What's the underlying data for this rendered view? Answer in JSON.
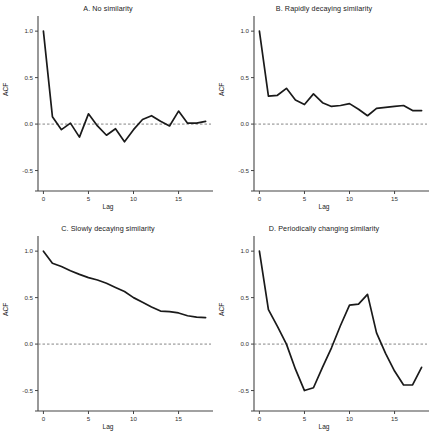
{
  "figure": {
    "name": "acf-panel-figure",
    "background": "#ffffff",
    "line_color": "#1a1a1a",
    "axis_color": "#444444",
    "zeroline_color": "#777777"
  },
  "axes": {
    "ylabel": "ACF",
    "xlabel": "Lag",
    "yticks": [
      "1.0",
      "0.5",
      "0.0",
      "-0.5"
    ],
    "ytick_values": [
      1.0,
      0.5,
      0.0,
      -0.5
    ],
    "xticks": [
      "0",
      "5",
      "10",
      "15"
    ],
    "xtick_values": [
      0,
      5,
      10,
      15
    ],
    "xlim": [
      -0.6,
      18.6
    ],
    "ylim": [
      -0.72,
      1.12
    ],
    "zero_line": 0.0,
    "grid": false
  },
  "chart_data": [
    {
      "type": "line",
      "panel": "A",
      "title": "A. No similarity",
      "xlabel": "Lag",
      "ylabel": "ACF",
      "xlim": [
        -0.6,
        18.6
      ],
      "ylim": [
        -0.72,
        1.12
      ],
      "grid": false,
      "legend": null,
      "x": [
        0,
        1,
        2,
        3,
        4,
        5,
        6,
        7,
        8,
        9,
        10,
        11,
        12,
        13,
        14,
        15,
        16,
        17,
        18
      ],
      "values": [
        1.0,
        0.08,
        -0.06,
        0.01,
        -0.14,
        0.11,
        -0.02,
        -0.12,
        -0.05,
        -0.19,
        -0.06,
        0.05,
        0.09,
        0.03,
        -0.02,
        0.14,
        0.01,
        0.01,
        0.03
      ]
    },
    {
      "type": "line",
      "panel": "B",
      "title": "B. Rapidly decaying similarity",
      "xlabel": "Lag",
      "ylabel": "ACF",
      "xlim": [
        -0.6,
        18.6
      ],
      "ylim": [
        -0.72,
        1.12
      ],
      "grid": false,
      "legend": null,
      "x": [
        0,
        1,
        2,
        3,
        4,
        5,
        6,
        7,
        8,
        9,
        10,
        11,
        12,
        13,
        14,
        15,
        16,
        17,
        18
      ],
      "values": [
        1.0,
        0.3,
        0.31,
        0.385,
        0.26,
        0.21,
        0.325,
        0.23,
        0.19,
        0.2,
        0.22,
        0.16,
        0.09,
        0.17,
        0.18,
        0.19,
        0.2,
        0.145,
        0.145
      ]
    },
    {
      "type": "line",
      "panel": "C",
      "title": "C. Slowly decaying similarity",
      "xlabel": "Lag",
      "ylabel": "ACF",
      "xlim": [
        -0.6,
        18.6
      ],
      "ylim": [
        -0.72,
        1.12
      ],
      "grid": false,
      "legend": null,
      "x": [
        0,
        1,
        2,
        3,
        4,
        5,
        6,
        7,
        8,
        9,
        10,
        11,
        12,
        13,
        14,
        15,
        16,
        17,
        18
      ],
      "values": [
        1.0,
        0.87,
        0.835,
        0.79,
        0.75,
        0.715,
        0.69,
        0.655,
        0.61,
        0.565,
        0.5,
        0.45,
        0.4,
        0.355,
        0.35,
        0.335,
        0.305,
        0.29,
        0.285
      ]
    },
    {
      "type": "line",
      "panel": "D",
      "title": "D. Periodically changing similarity",
      "xlabel": "Lag",
      "ylabel": "ACF",
      "xlim": [
        -0.6,
        18.6
      ],
      "ylim": [
        -0.72,
        1.12
      ],
      "grid": false,
      "legend": null,
      "x": [
        0,
        1,
        2,
        3,
        4,
        5,
        6,
        7,
        8,
        9,
        10,
        11,
        12,
        13,
        14,
        15,
        16,
        17,
        18
      ],
      "values": [
        1.0,
        0.37,
        0.19,
        0.0,
        -0.27,
        -0.5,
        -0.47,
        -0.25,
        -0.04,
        0.2,
        0.42,
        0.43,
        0.535,
        0.12,
        -0.1,
        -0.29,
        -0.44,
        -0.44,
        -0.25
      ]
    }
  ]
}
